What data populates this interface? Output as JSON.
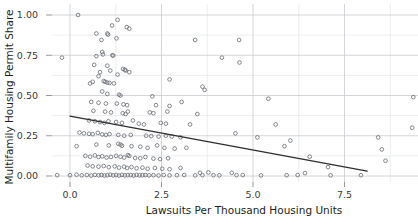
{
  "chart_data": {
    "type": "scatter",
    "title": "",
    "xlabel": "Lawsuits Per Thousand  Housing Units",
    "ylabel": "Multifamily Housing Permit Share",
    "xlim": [
      -0.55,
      9.6
    ],
    "ylim": [
      -0.045,
      1.04
    ],
    "xticks": [
      0.0,
      2.5,
      5.0,
      7.5
    ],
    "xticklabels": [
      "0.0",
      "2.5",
      "5.0",
      "7.5"
    ],
    "yticks": [
      0.0,
      0.25,
      0.5,
      0.75,
      1.0
    ],
    "yticklabels": [
      "0.00",
      "0.25",
      "0.50",
      "0.75",
      "1.00"
    ],
    "x_minor_ticks": [
      1.25,
      3.75,
      6.25,
      8.75
    ],
    "y_minor_ticks": [
      0.125,
      0.375,
      0.625,
      0.875
    ],
    "grid": true,
    "legend": "none",
    "marker": "open-circle",
    "marker_color": "#6e7278",
    "trendline": {
      "type": "linear-fit",
      "color": "#2e2e2e",
      "x_start": 0.0,
      "y_start": 0.372,
      "x_end": 8.12,
      "y_end": 0.03,
      "slope": -0.0421,
      "intercept": 0.372
    },
    "points": [
      [
        0.22,
        1.0
      ],
      [
        1.3,
        0.97
      ],
      [
        1.15,
        0.935
      ],
      [
        1.55,
        0.925
      ],
      [
        1.62,
        0.915
      ],
      [
        0.72,
        0.885
      ],
      [
        1.02,
        0.885
      ],
      [
        1.04,
        0.878
      ],
      [
        3.42,
        0.845
      ],
      [
        4.62,
        0.845
      ],
      [
        0.86,
        0.845
      ],
      [
        1.27,
        0.855
      ],
      [
        -0.22,
        0.735
      ],
      [
        0.72,
        0.745
      ],
      [
        0.88,
        0.77
      ],
      [
        0.9,
        0.755
      ],
      [
        1.16,
        0.75
      ],
      [
        1.18,
        0.748
      ],
      [
        4.15,
        0.735
      ],
      [
        4.63,
        0.705
      ],
      [
        0.66,
        0.69
      ],
      [
        1.02,
        0.685
      ],
      [
        1.45,
        0.665
      ],
      [
        1.5,
        0.66
      ],
      [
        1.52,
        0.655
      ],
      [
        1.62,
        0.645
      ],
      [
        0.82,
        0.645
      ],
      [
        1.1,
        0.655
      ],
      [
        1.3,
        0.63
      ],
      [
        0.78,
        0.62
      ],
      [
        0.62,
        0.585
      ],
      [
        0.55,
        0.575
      ],
      [
        0.92,
        0.59
      ],
      [
        0.96,
        0.585
      ],
      [
        1.02,
        0.58
      ],
      [
        1.08,
        0.578
      ],
      [
        1.2,
        0.575
      ],
      [
        2.72,
        0.6
      ],
      [
        3.62,
        0.555
      ],
      [
        3.68,
        0.535
      ],
      [
        0.88,
        0.525
      ],
      [
        1.02,
        0.51
      ],
      [
        1.34,
        0.505
      ],
      [
        1.38,
        0.5
      ],
      [
        2.25,
        0.495
      ],
      [
        5.42,
        0.48
      ],
      [
        0.58,
        0.46
      ],
      [
        0.78,
        0.455
      ],
      [
        0.98,
        0.45
      ],
      [
        1.28,
        0.45
      ],
      [
        1.46,
        0.445
      ],
      [
        1.56,
        0.44
      ],
      [
        2.35,
        0.44
      ],
      [
        2.72,
        0.435
      ],
      [
        3.05,
        0.46
      ],
      [
        0.64,
        0.405
      ],
      [
        0.96,
        0.4
      ],
      [
        1.12,
        0.395
      ],
      [
        1.44,
        0.39
      ],
      [
        1.52,
        0.385
      ],
      [
        1.58,
        0.4
      ],
      [
        2.18,
        0.395
      ],
      [
        2.28,
        0.39
      ],
      [
        2.66,
        0.4
      ],
      [
        3.48,
        0.385
      ],
      [
        0.52,
        0.345
      ],
      [
        0.68,
        0.34
      ],
      [
        0.82,
        0.335
      ],
      [
        0.94,
        0.33
      ],
      [
        1.05,
        0.34
      ],
      [
        1.26,
        0.335
      ],
      [
        1.42,
        0.33
      ],
      [
        1.72,
        0.345
      ],
      [
        1.88,
        0.325
      ],
      [
        2.02,
        0.32
      ],
      [
        2.48,
        0.33
      ],
      [
        2.62,
        0.325
      ],
      [
        3.28,
        0.32
      ],
      [
        9.35,
        0.3
      ],
      [
        0.26,
        0.27
      ],
      [
        0.38,
        0.265
      ],
      [
        0.52,
        0.262
      ],
      [
        0.62,
        0.26
      ],
      [
        0.76,
        0.268
      ],
      [
        0.88,
        0.258
      ],
      [
        0.98,
        0.255
      ],
      [
        1.08,
        0.26
      ],
      [
        1.32,
        0.255
      ],
      [
        1.48,
        0.25
      ],
      [
        1.66,
        0.255
      ],
      [
        2.08,
        0.25
      ],
      [
        2.22,
        0.248
      ],
      [
        2.42,
        0.245
      ],
      [
        2.62,
        0.25
      ],
      [
        2.78,
        0.245
      ],
      [
        3.02,
        0.24
      ],
      [
        4.52,
        0.265
      ],
      [
        5.12,
        0.24
      ],
      [
        8.42,
        0.24
      ],
      [
        0.18,
        0.185
      ],
      [
        0.72,
        0.195
      ],
      [
        1.06,
        0.19
      ],
      [
        1.32,
        0.2
      ],
      [
        1.38,
        0.195
      ],
      [
        1.42,
        0.188
      ],
      [
        1.68,
        0.185
      ],
      [
        1.92,
        0.182
      ],
      [
        2.12,
        0.175
      ],
      [
        2.38,
        0.19
      ],
      [
        2.58,
        0.175
      ],
      [
        2.86,
        0.17
      ],
      [
        3.18,
        0.175
      ],
      [
        5.86,
        0.185
      ],
      [
        8.52,
        0.165
      ],
      [
        0.42,
        0.125
      ],
      [
        0.55,
        0.12
      ],
      [
        0.68,
        0.128
      ],
      [
        0.78,
        0.118
      ],
      [
        0.88,
        0.122
      ],
      [
        1.0,
        0.115
      ],
      [
        1.12,
        0.118
      ],
      [
        1.26,
        0.125
      ],
      [
        1.38,
        0.12
      ],
      [
        1.48,
        0.115
      ],
      [
        1.58,
        0.13
      ],
      [
        1.62,
        0.125
      ],
      [
        1.78,
        0.112
      ],
      [
        1.92,
        0.11
      ],
      [
        2.06,
        0.118
      ],
      [
        2.28,
        0.108
      ],
      [
        2.46,
        0.105
      ],
      [
        2.68,
        0.11
      ],
      [
        8.62,
        0.095
      ],
      [
        0.48,
        0.065
      ],
      [
        0.62,
        0.06
      ],
      [
        0.78,
        0.058
      ],
      [
        0.92,
        0.062
      ],
      [
        1.06,
        0.055
      ],
      [
        1.22,
        0.06
      ],
      [
        1.34,
        0.052
      ],
      [
        1.48,
        0.058
      ],
      [
        1.56,
        0.05
      ],
      [
        1.68,
        0.055
      ],
      [
        1.82,
        0.048
      ],
      [
        1.98,
        0.052
      ],
      [
        2.12,
        0.045
      ],
      [
        2.32,
        0.05
      ],
      [
        2.52,
        0.045
      ],
      [
        2.72,
        0.042
      ],
      [
        3.02,
        0.05
      ],
      [
        -0.35,
        0.005
      ],
      [
        0.0,
        0.005
      ],
      [
        0.18,
        0.008
      ],
      [
        0.32,
        0.004
      ],
      [
        0.46,
        0.006
      ],
      [
        0.58,
        0.003
      ],
      [
        0.68,
        0.007
      ],
      [
        0.78,
        0.004
      ],
      [
        0.86,
        0.006
      ],
      [
        0.94,
        0.003
      ],
      [
        1.02,
        0.005
      ],
      [
        1.1,
        0.008
      ],
      [
        1.18,
        0.004
      ],
      [
        1.26,
        0.006
      ],
      [
        1.34,
        0.003
      ],
      [
        1.42,
        0.007
      ],
      [
        1.5,
        0.004
      ],
      [
        1.58,
        0.005
      ],
      [
        1.66,
        0.006
      ],
      [
        1.74,
        0.003
      ],
      [
        1.82,
        0.007
      ],
      [
        1.9,
        0.004
      ],
      [
        1.98,
        0.005
      ],
      [
        2.06,
        0.006
      ],
      [
        2.16,
        0.004
      ],
      [
        2.28,
        0.005
      ],
      [
        2.42,
        0.003
      ],
      [
        2.56,
        0.006
      ],
      [
        2.72,
        0.004
      ],
      [
        2.92,
        0.005
      ],
      [
        3.12,
        0.006
      ],
      [
        3.42,
        0.004
      ],
      [
        3.55,
        0.02
      ],
      [
        3.62,
        0.005
      ],
      [
        3.78,
        0.022
      ],
      [
        3.92,
        0.005
      ],
      [
        4.08,
        0.004
      ],
      [
        4.42,
        0.02
      ],
      [
        4.55,
        0.005
      ],
      [
        4.72,
        0.006
      ],
      [
        5.22,
        0.004
      ],
      [
        5.92,
        0.005
      ],
      [
        6.22,
        0.006
      ],
      [
        6.42,
        0.018
      ],
      [
        7.12,
        0.004
      ],
      [
        6.55,
        0.12
      ],
      [
        7.05,
        0.055
      ],
      [
        6.02,
        0.22
      ],
      [
        5.62,
        0.32
      ],
      [
        7.95,
        0.005
      ],
      [
        9.38,
        0.49
      ]
    ]
  }
}
